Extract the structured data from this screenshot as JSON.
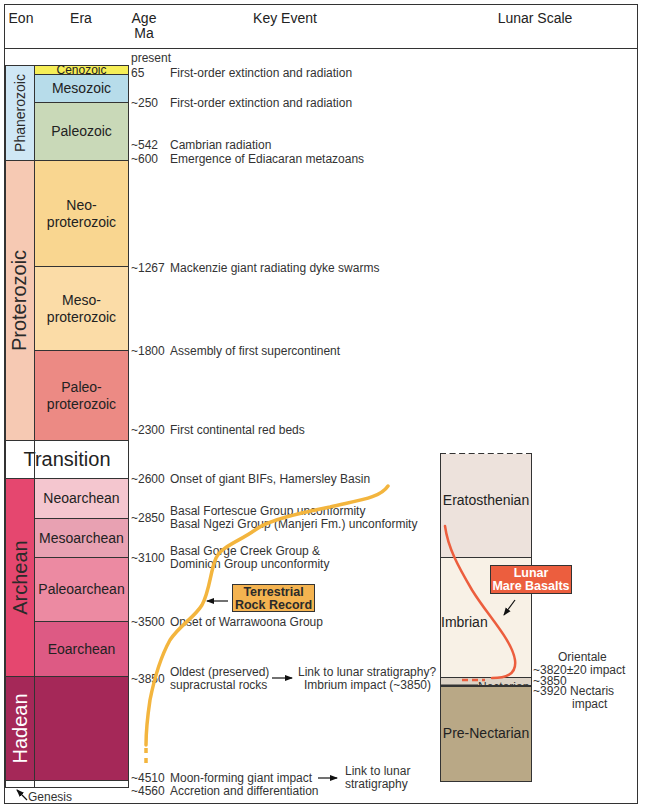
{
  "header": {
    "eon": "Eon",
    "era": "Era",
    "age_line1": "Age",
    "age_line2": "Ma",
    "key_event": "Key Event",
    "lunar_scale": "Lunar Scale"
  },
  "colors": {
    "cenozoic": "#f6ee57",
    "mesozoic": "#b7dcea",
    "paleozoic": "#c9d9b8",
    "phanerozoic": "#cfe7f5",
    "proterozoic": "#f6c9b3",
    "neoproterozoic": "#f9d690",
    "mesoproterozoic": "#fbdca7",
    "paleoproterozoic": "#ec8a84",
    "archean": "#e5476f",
    "neoarchean": "#f4c6cf",
    "mesoarchean": "#e8a1b2",
    "paleoarchean": "#ec8aa2",
    "eoarchean": "#dd5a84",
    "hadean": "#a52858",
    "eratosthenian": "#ede2dc",
    "imbrian": "#f8f1e6",
    "nectarian": "#ddd3c6",
    "pre_nectarian": "#b9a886",
    "terrestrial_curve": "#f3b53e",
    "basalt_curve": "#ec5e3e"
  },
  "eons": [
    {
      "name": "Phanerozoic"
    },
    {
      "name": "Proterozoic"
    },
    {
      "name": "Transition"
    },
    {
      "name": "Archean"
    },
    {
      "name": "Hadean"
    }
  ],
  "eras": [
    {
      "name": "Cenozoic"
    },
    {
      "name": "Mesozoic"
    },
    {
      "name": "Paleozoic"
    },
    {
      "name": "Neo-\nproterozoic",
      "l1": "Neo-",
      "l2": "proterozoic"
    },
    {
      "name": "Meso-\nproterozoic",
      "l1": "Meso-",
      "l2": "proterozoic"
    },
    {
      "name": "Paleo-\nproterozoic",
      "l1": "Paleo-",
      "l2": "proterozoic"
    },
    {
      "name": "Neoarchean"
    },
    {
      "name": "Mesoarchean"
    },
    {
      "name": "Paleoarchean"
    },
    {
      "name": "Eoarchean"
    }
  ],
  "events": [
    {
      "age": "present",
      "text": ""
    },
    {
      "age": "65",
      "text": "First-order extinction and radiation"
    },
    {
      "age": "~250",
      "text": "First-order extinction and radiation"
    },
    {
      "age": "~542",
      "text": "Cambrian radiation"
    },
    {
      "age": "~600",
      "text": "Emergence of Ediacaran metazoans"
    },
    {
      "age": "~1267",
      "text": "Mackenzie giant radiating dyke swarms"
    },
    {
      "age": "~1800",
      "text": "Assembly of first supercontinent"
    },
    {
      "age": "~2300",
      "text": "First continental red beds"
    },
    {
      "age": "~2600",
      "text": "Onset of giant BIFs, Hamersley Basin"
    },
    {
      "age": "~2850",
      "text": "Basal Fortescue Group unconformity",
      "text2": "Basal Ngezi Group (Manjeri Fm.) unconformity"
    },
    {
      "age": "~3100",
      "text": "Basal Gorge Creek Group &",
      "text2": "Dominion Group unconformity"
    },
    {
      "age": "~3500",
      "text": "Onset of Warrawoona Group"
    },
    {
      "age": "~3850",
      "text": "Oldest (preserved)",
      "text2": "supracrustal rocks",
      "link1": "Link to lunar stratigraphy?",
      "link2": "Imbrium impact (~3850)"
    },
    {
      "age": "~4510",
      "text": "Moon-forming giant impact",
      "link1": "Link to lunar",
      "link2": "stratigraphy"
    },
    {
      "age": "~4560",
      "text": "Accretion and differentiation"
    }
  ],
  "genesis_label": "Genesis",
  "terrestrial_label": {
    "l1": "Terrestrial",
    "l2": "Rock Record"
  },
  "lunar": {
    "periods": [
      {
        "name": "Eratosthenian"
      },
      {
        "name": "Imbrian"
      },
      {
        "name": "Nectarian"
      },
      {
        "name": "Pre-Nectarian"
      }
    ],
    "basalt_label": {
      "l1": "Lunar",
      "l2": "Mare Basalts"
    },
    "annotations": {
      "orientale_l1": "Orientale",
      "orientale_l2": "~3820±20 impact",
      "age_3850": "~3850",
      "nectaris_l1": "~3920 Nectaris",
      "nectaris_l2": "impact"
    }
  }
}
